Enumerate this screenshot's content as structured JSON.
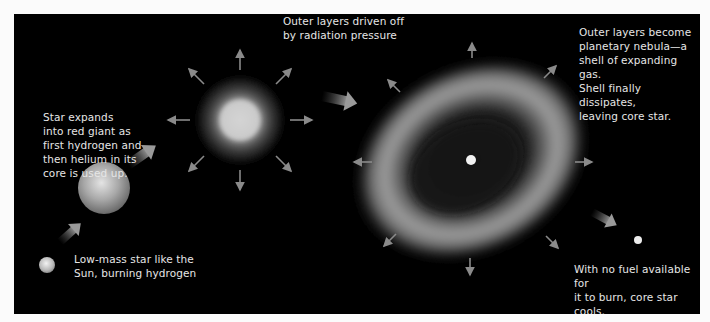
{
  "diagram": {
    "stages": [
      {
        "id": "sun",
        "caption": "Low-mass star like the\nSun, burning hydrogen"
      },
      {
        "id": "red-giant",
        "caption": "Star expands\ninto red giant as\nfirst hydrogen and\nthen helium in its\ncore is used up."
      },
      {
        "id": "outer-layers",
        "caption": "Outer layers driven off\nby radiation pressure"
      },
      {
        "id": "planetary-nebula",
        "caption": "Outer layers become\nplanetary nebula—a\nshell of expanding gas.\nShell finally dissipates,\nleaving core star."
      },
      {
        "id": "white-dwarf",
        "caption": "With no fuel available for\nit to burn, core star cools,\nbecomes a white dwarf."
      }
    ],
    "colors": {
      "background": "#000000",
      "page": "#fbfbfb",
      "text": "#e6e6e6",
      "star": "#d8d8d8",
      "arrow": "#8a8a8a"
    }
  }
}
